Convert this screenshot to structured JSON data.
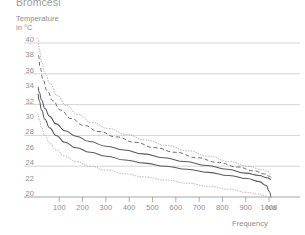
{
  "header": {
    "cropped_caption": "Bromcesi"
  },
  "chart_data": {
    "type": "line",
    "title": "",
    "ylabel": "Temperature\nin °C",
    "ylabel_text": "Temperature",
    "yunit_text": "in °C",
    "xlabel": "Frequency",
    "xunit": "h/a",
    "xlim": [
      0,
      1030
    ],
    "ylim": [
      19.2,
      41.0
    ],
    "yticks": [
      40,
      38,
      36,
      34,
      32,
      30,
      28,
      26,
      24,
      22,
      20
    ],
    "ytick_labels": [
      "40",
      "38",
      "36",
      "34",
      "32",
      "30",
      "28",
      "26",
      "24",
      "22",
      "20"
    ],
    "gridlines_y": [
      40,
      36,
      32,
      28,
      24
    ],
    "grid": true,
    "xticks": [
      100,
      200,
      300,
      400,
      500,
      600,
      700,
      800,
      900,
      1000
    ],
    "xtick_labels": [
      "100",
      "200",
      "300",
      "400",
      "500",
      "600",
      "700",
      "800",
      "900",
      "1000"
    ],
    "legend": "none",
    "colors": {
      "grid": "#c9c9c9",
      "axis": "#9a9a9a",
      "solid_line": "#5a5a5a",
      "dashed_line": "#6a6a6a",
      "dotted_line": "#a8a8a8",
      "text": "#8d8d8d"
    },
    "series": [
      {
        "name": "upper-bound-dotted",
        "style": "dotted",
        "x": [
          8,
          15,
          25,
          40,
          60,
          90,
          130,
          180,
          240,
          310,
          390,
          470,
          560,
          650,
          740,
          830,
          910,
          965,
          995,
          1008
        ],
        "values": [
          40.6,
          39.0,
          37.4,
          36.0,
          34.7,
          33.2,
          31.9,
          30.7,
          29.7,
          28.9,
          28.1,
          27.4,
          26.7,
          26.0,
          25.3,
          24.6,
          24.0,
          23.6,
          23.3,
          23.0
        ]
      },
      {
        "name": "upper-mid-dashed",
        "style": "dashed",
        "x": [
          10,
          18,
          30,
          48,
          72,
          105,
          150,
          205,
          270,
          345,
          425,
          510,
          600,
          690,
          780,
          865,
          935,
          980,
          1002,
          1012
        ],
        "values": [
          38.4,
          36.8,
          35.2,
          33.8,
          32.5,
          31.3,
          30.2,
          29.3,
          28.5,
          27.8,
          27.1,
          26.4,
          25.8,
          25.1,
          24.5,
          23.9,
          23.4,
          23.0,
          22.7,
          22.5
        ]
      },
      {
        "name": "median-solid-upper",
        "style": "solid",
        "x": [
          8,
          14,
          24,
          38,
          58,
          86,
          124,
          172,
          230,
          300,
          378,
          460,
          548,
          640,
          732,
          820,
          900,
          958,
          992,
          1008
        ],
        "values": [
          34.3,
          33.6,
          32.6,
          31.5,
          30.5,
          29.5,
          28.6,
          27.9,
          27.2,
          26.6,
          26.1,
          25.6,
          25.1,
          24.6,
          24.1,
          23.6,
          23.1,
          22.8,
          22.5,
          22.3
        ]
      },
      {
        "name": "median-solid-lower",
        "style": "solid",
        "x": [
          8,
          14,
          24,
          38,
          58,
          86,
          124,
          172,
          232,
          302,
          382,
          466,
          556,
          648,
          740,
          828,
          906,
          958,
          988,
          1002,
          1010
        ],
        "values": [
          33.4,
          32.5,
          31.3,
          30.1,
          29.0,
          28.0,
          27.1,
          26.4,
          25.8,
          25.3,
          24.8,
          24.4,
          24.0,
          23.6,
          23.2,
          22.8,
          22.4,
          22.0,
          21.5,
          20.7,
          19.9
        ]
      },
      {
        "name": "lower-bound-dotted",
        "style": "dotted",
        "x": [
          8,
          14,
          24,
          38,
          58,
          86,
          124,
          172,
          232,
          302,
          382,
          466,
          556,
          648,
          740,
          828,
          906,
          952,
          978,
          992
        ],
        "values": [
          30.8,
          30.0,
          29.0,
          28.0,
          27.0,
          26.1,
          25.3,
          24.6,
          24.0,
          23.5,
          23.0,
          22.6,
          22.2,
          21.8,
          21.4,
          21.0,
          20.6,
          20.4,
          20.2,
          20.1
        ]
      }
    ]
  }
}
